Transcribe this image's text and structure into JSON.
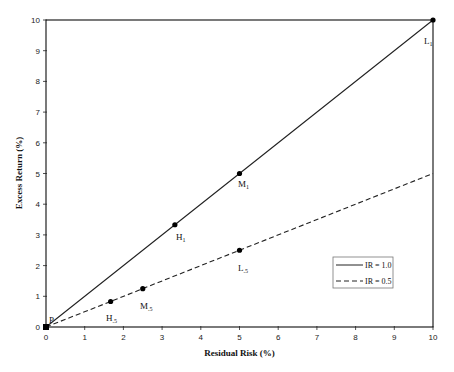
{
  "chart_data": {
    "type": "line",
    "title": "",
    "xlabel": "Residual Risk (%)",
    "ylabel": "Excess Return (%)",
    "xlim": [
      0,
      10
    ],
    "ylim": [
      0,
      10
    ],
    "xticks": [
      "0",
      "1",
      "2",
      "3",
      "4",
      "5",
      "6",
      "7",
      "8",
      "9",
      "10"
    ],
    "yticks": [
      "0",
      "1",
      "2",
      "3",
      "4",
      "5",
      "6",
      "7",
      "8",
      "9",
      "10"
    ],
    "grid": false,
    "legend_position": "lower right (inside)",
    "series": [
      {
        "name": "IR = 1.0",
        "style": "solid",
        "x": [
          0,
          3.33,
          5,
          10
        ],
        "y": [
          0,
          3.33,
          5,
          10
        ],
        "point_labels": [
          "P",
          "H1",
          "M1",
          "L1"
        ]
      },
      {
        "name": "IR = 0.5",
        "style": "dashed",
        "x": [
          0,
          1.67,
          2.5,
          5,
          10
        ],
        "y": [
          0,
          0.83,
          1.25,
          2.5,
          5
        ],
        "point_labels": [
          "P",
          "H.5",
          "M.5",
          "L.5",
          ""
        ]
      }
    ],
    "annotations": [
      {
        "text": "P",
        "x": 0,
        "y": 0
      },
      {
        "text": "H1",
        "x": 3.33,
        "y": 3.33
      },
      {
        "text": "M1",
        "x": 5,
        "y": 5
      },
      {
        "text": "L1",
        "x": 10,
        "y": 10
      },
      {
        "text": "H.5",
        "x": 1.67,
        "y": 0.83
      },
      {
        "text": "M.5",
        "x": 2.5,
        "y": 1.25
      },
      {
        "text": "L.5",
        "x": 5,
        "y": 2.5
      }
    ]
  },
  "labels": {
    "xlabel": "Residual Risk (%)",
    "ylabel": "Excess Return (%)",
    "legend": [
      "IR = 1.0",
      "IR = 0.5"
    ],
    "points": {
      "P": "P",
      "H1": "H",
      "H1_sub": "1",
      "M1": "M",
      "M1_sub": "1",
      "L1": "L",
      "L1_sub": "1",
      "H5": "H",
      "H5_sub": ".5",
      "M5": "M",
      "M5_sub": ".5",
      "L5": "L",
      "L5_sub": ".5"
    }
  }
}
